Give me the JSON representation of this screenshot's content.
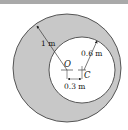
{
  "figure": {
    "colors": {
      "disk_fill": "#c8c8c8",
      "hole_fill": "#ffffff",
      "stroke": "#222222",
      "top_bar": "#a9a9a9"
    },
    "labels": {
      "outer_radius": "1 m",
      "inner_radius": "0.6 m",
      "center_outer": "O",
      "center_inner": "C",
      "offset": "0.3 m"
    }
  }
}
